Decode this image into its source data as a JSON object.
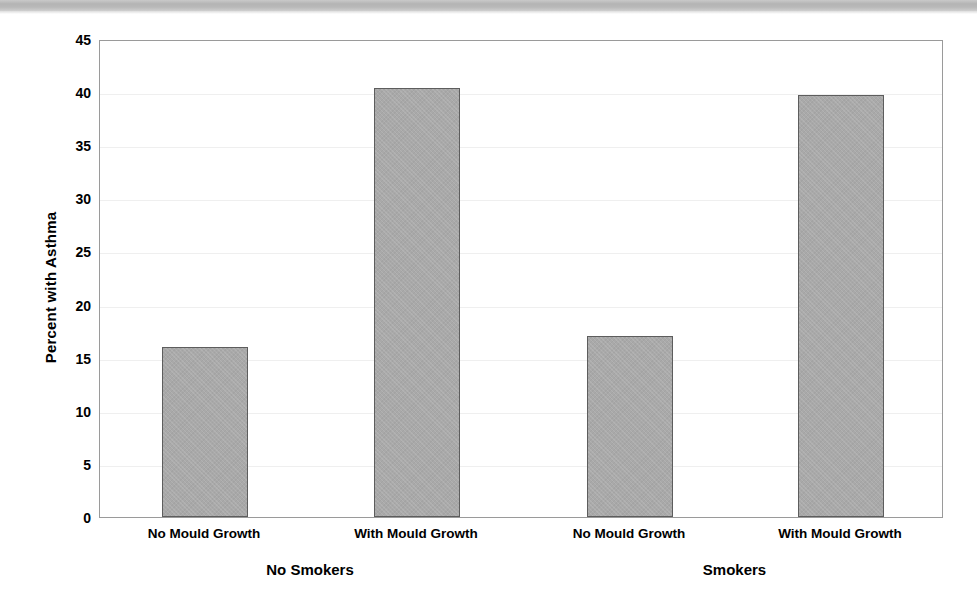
{
  "chart_data": {
    "type": "bar",
    "title": "",
    "subtitle": "",
    "xlabel": "",
    "ylabel": "Percent with Asthma",
    "ylim": [
      0,
      45
    ],
    "ytick_step": 5,
    "ytick_labels": [
      "45",
      "40",
      "35",
      "30",
      "25",
      "20",
      "15",
      "10",
      "5",
      "0"
    ],
    "ytick_values": [
      45,
      40,
      35,
      30,
      25,
      20,
      15,
      10,
      5,
      0
    ],
    "grid": true,
    "legend": "none",
    "categories": [
      "No Mould Growth",
      "With Mould Growth",
      "No Mould Growth",
      "With Mould Growth"
    ],
    "values": [
      16.0,
      40.4,
      17.0,
      39.7
    ],
    "groups": [
      {
        "name": "No Smokers",
        "categories": [
          "No Mould Growth",
          "With Mould Growth"
        ],
        "values": [
          16.0,
          40.4
        ]
      },
      {
        "name": "Smokers",
        "categories": [
          "No Mould Growth",
          "With Mould Growth"
        ],
        "values": [
          17.0,
          39.7
        ]
      }
    ],
    "bars": [
      {
        "label": "No Mould Growth",
        "group": "No Smokers",
        "value": 16.0
      },
      {
        "label": "With Mould Growth",
        "group": "No Smokers",
        "value": 40.4
      },
      {
        "label": "No Mould Growth",
        "group": "Smokers",
        "value": 17.0
      },
      {
        "label": "With Mould Growth",
        "group": "Smokers",
        "value": 39.7
      }
    ],
    "colors": {
      "bar_fill": "#a9a9a9",
      "bar_border": "#5d5d5d",
      "gridline": "#efefef",
      "axis_border": "#9a9a9a",
      "text": "#000000",
      "scan_band": "#b8b8b8",
      "background": "#ffffff"
    }
  }
}
